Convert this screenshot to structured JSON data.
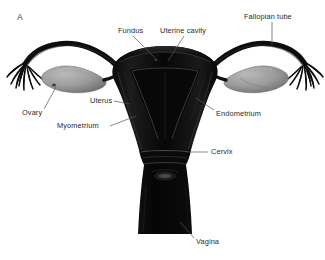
{
  "figure": {
    "panel_letter": "A",
    "background_color": "#ffffff",
    "organ_color": "#0d0d0d",
    "ovary_color": "#9a9a9a",
    "leader_color": "#555555",
    "text_color": "#2b2b2b"
  },
  "labels": [
    {
      "id": "fundus",
      "text": "Fundus",
      "x": 118,
      "y": 31
    },
    {
      "id": "uterine-cavity",
      "text": "Uterine cavity",
      "x": 172,
      "y": 31
    },
    {
      "id": "fallopian-tube",
      "text": "Fallopian tube",
      "x": 248,
      "y": 17
    },
    {
      "id": "ovary",
      "text": "Ovary",
      "x": 22,
      "y": 111
    },
    {
      "id": "uterus",
      "text": "Uterus",
      "x": 90,
      "y": 99
    },
    {
      "id": "myometrium",
      "text": "Myometrium",
      "x": 57,
      "y": 124
    },
    {
      "id": "endometrium",
      "text": "Endometrium",
      "x": 216,
      "y": 112
    },
    {
      "id": "cervix",
      "text": "Cervix",
      "x": 211,
      "y": 150
    },
    {
      "id": "vagina",
      "text": "Vagina",
      "x": 196,
      "y": 241
    }
  ]
}
